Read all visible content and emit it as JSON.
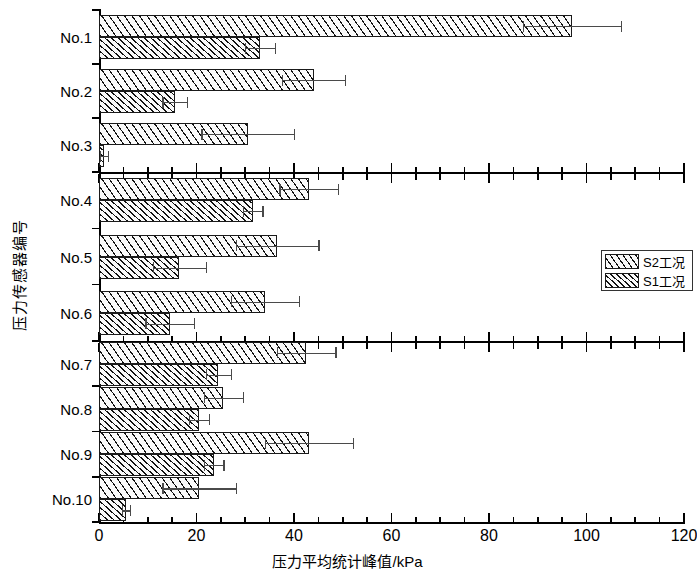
{
  "chart_data": {
    "type": "bar",
    "orientation": "horizontal",
    "title": "",
    "xlabel": "压力平均统计峰值/kPa",
    "ylabel": "压力传感器编号",
    "xlim": [
      0,
      120
    ],
    "xticks": [
      0,
      20,
      40,
      60,
      80,
      100,
      120
    ],
    "xtick_labels": [
      "0",
      "20",
      "40",
      "60",
      "80",
      "100",
      "120"
    ],
    "minor_tick_step": 5,
    "grid": false,
    "legend_position": "right-middle",
    "categories": [
      "No.1",
      "No.2",
      "No.3",
      "No.4",
      "No.5",
      "No.6",
      "No.7",
      "No.8",
      "No.9",
      "No.10"
    ],
    "series": [
      {
        "name": "S2工况",
        "values": [
          97.0,
          44.0,
          30.5,
          43.0,
          36.5,
          34.0,
          42.5,
          25.5,
          43.0,
          20.5
        ],
        "errors": [
          10.0,
          6.5,
          9.5,
          6.0,
          8.5,
          7.0,
          6.0,
          4.0,
          9.0,
          7.5
        ]
      },
      {
        "name": "S1工况",
        "values": [
          33.0,
          15.5,
          1.0,
          31.5,
          16.5,
          14.5,
          24.5,
          20.5,
          23.5,
          5.5
        ],
        "errors": [
          3.0,
          2.5,
          0.8,
          2.0,
          5.5,
          5.0,
          2.5,
          2.0,
          2.0,
          0.8
        ]
      }
    ],
    "section_dividers_after": [
      "No.3",
      "No.6"
    ]
  },
  "legend": {
    "items": [
      {
        "label": "S2工况",
        "pattern": "sparse-hatch"
      },
      {
        "label": "S1工况",
        "pattern": "dense-hatch"
      }
    ]
  }
}
